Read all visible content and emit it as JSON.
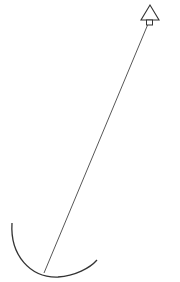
{
  "diagram": {
    "stroke_color": "#333333",
    "background": "#ffffff",
    "arrowhead": {
      "apex": [
        150,
        5
      ],
      "base_left": [
        140,
        20
      ],
      "base_right": [
        160,
        20
      ]
    },
    "tab": {
      "x": 146,
      "y": 20,
      "w": 6,
      "h": 5
    },
    "rod": {
      "from": [
        148,
        24
      ],
      "to": [
        44,
        273
      ]
    },
    "arc": {
      "start": [
        12,
        223
      ],
      "control": [
        22,
        300
      ],
      "end": [
        97,
        260
      ]
    }
  }
}
